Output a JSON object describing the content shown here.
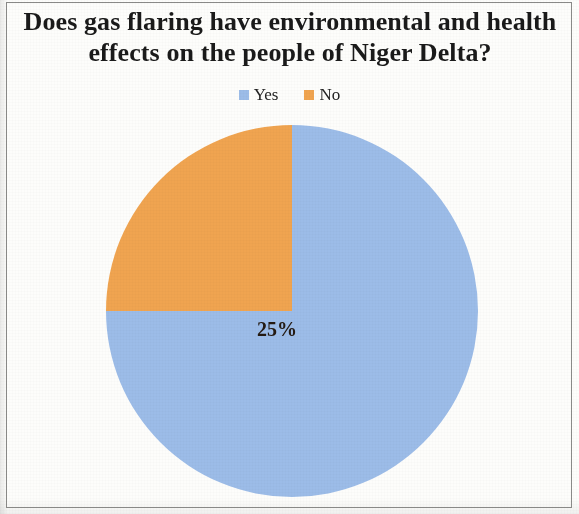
{
  "chart_data": {
    "type": "pie",
    "title": "Does gas flaring have environmental and health effects on the people of Niger Delta?",
    "title_line1": "Does gas flaring have environmental and health",
    "title_line2": "effects on the people of Niger Delta?",
    "categories": [
      "Yes",
      "No"
    ],
    "values": [
      75,
      25
    ],
    "value_labels": [
      "75%",
      "25%"
    ],
    "unit": "%",
    "colors": [
      "#9CBCE8",
      "#F0A450"
    ],
    "legend_position": "top",
    "start_angle_deg": 0,
    "direction": "clockwise",
    "grid": false,
    "xlabel": "",
    "ylabel": "",
    "slices": [
      {
        "name": "Yes",
        "value": 75,
        "label": "75%",
        "color": "#9CBCE8",
        "start_angle_deg": 0,
        "end_angle_deg": 270
      },
      {
        "name": "No",
        "value": 25,
        "label": "25%",
        "color": "#F0A450",
        "start_angle_deg": 270,
        "end_angle_deg": 360
      }
    ]
  },
  "legend": {
    "items": [
      {
        "label": "Yes",
        "color": "#9CBCE8"
      },
      {
        "label": "No",
        "color": "#F0A450"
      }
    ]
  }
}
